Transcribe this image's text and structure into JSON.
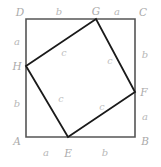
{
  "figure": {
    "type": "geometry-diagram",
    "background_color": "#ffffff",
    "outer_square": {
      "stroke_color": "#555555",
      "stroke_width": 1.6,
      "corners": {
        "A": {
          "x": 26,
          "y": 137
        },
        "B": {
          "x": 135,
          "y": 137
        },
        "C": {
          "x": 135,
          "y": 19
        },
        "D": {
          "x": 26,
          "y": 19
        }
      }
    },
    "inner_square": {
      "stroke_color": "#1a1a1a",
      "stroke_width": 1.8,
      "vertices": {
        "E": {
          "x": 68,
          "y": 137
        },
        "F": {
          "x": 135,
          "y": 92
        },
        "G": {
          "x": 96,
          "y": 19
        },
        "H": {
          "x": 26,
          "y": 66
        }
      }
    },
    "vertex_labels": [
      {
        "name": "D",
        "text": "D",
        "x": 20,
        "y": 12
      },
      {
        "name": "G",
        "text": "G",
        "x": 96,
        "y": 11
      },
      {
        "name": "C",
        "text": "C",
        "x": 143,
        "y": 12
      },
      {
        "name": "H",
        "text": "H",
        "x": 17,
        "y": 66
      },
      {
        "name": "F",
        "text": "F",
        "x": 144,
        "y": 92
      },
      {
        "name": "A",
        "text": "A",
        "x": 17,
        "y": 141
      },
      {
        "name": "E",
        "text": "E",
        "x": 68,
        "y": 153
      },
      {
        "name": "B",
        "text": "B",
        "x": 145,
        "y": 141
      }
    ],
    "side_labels": [
      {
        "name": "top-b",
        "text": "b",
        "x": 59,
        "y": 12
      },
      {
        "name": "top-a",
        "text": "a",
        "x": 117,
        "y": 12
      },
      {
        "name": "left-a",
        "text": "a",
        "x": 17,
        "y": 42
      },
      {
        "name": "left-b",
        "text": "b",
        "x": 17,
        "y": 104
      },
      {
        "name": "right-b",
        "text": "b",
        "x": 145,
        "y": 55
      },
      {
        "name": "right-a",
        "text": "a",
        "x": 145,
        "y": 117
      },
      {
        "name": "bottom-a",
        "text": "a",
        "x": 46,
        "y": 153
      },
      {
        "name": "bottom-b",
        "text": "b",
        "x": 105,
        "y": 153
      }
    ],
    "inner_labels": [
      {
        "name": "c-top-left",
        "text": "c",
        "x": 64,
        "y": 53
      },
      {
        "name": "c-top-right",
        "text": "c",
        "x": 110,
        "y": 61
      },
      {
        "name": "c-bottom-left",
        "text": "c",
        "x": 61,
        "y": 99
      },
      {
        "name": "c-bottom-right",
        "text": "c",
        "x": 102,
        "y": 107
      }
    ]
  }
}
